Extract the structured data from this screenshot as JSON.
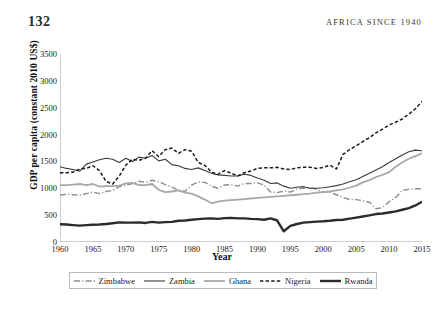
{
  "page": {
    "folio": "132",
    "running_head": "AFRICA SINCE 1940"
  },
  "chart_data": {
    "type": "line",
    "title": "",
    "xlabel": "Year",
    "ylabel": "GDP per capita (constant 2010 US$)",
    "xlim": [
      1960,
      2015
    ],
    "ylim": [
      0,
      3500
    ],
    "xticks": [
      1960,
      1965,
      1970,
      1975,
      1980,
      1985,
      1990,
      1995,
      2000,
      2005,
      2010,
      2015
    ],
    "yticks": [
      0,
      500,
      1000,
      1500,
      2000,
      2500,
      3000,
      3500
    ],
    "grid": false,
    "legend_position": "bottom",
    "x": [
      1960,
      1961,
      1962,
      1963,
      1964,
      1965,
      1966,
      1967,
      1968,
      1969,
      1970,
      1971,
      1972,
      1973,
      1974,
      1975,
      1976,
      1977,
      1978,
      1979,
      1980,
      1981,
      1982,
      1983,
      1984,
      1985,
      1986,
      1987,
      1988,
      1989,
      1990,
      1991,
      1992,
      1993,
      1994,
      1995,
      1996,
      1997,
      1998,
      1999,
      2000,
      2001,
      2002,
      2003,
      2004,
      2005,
      2006,
      2007,
      2008,
      2009,
      2010,
      2011,
      2012,
      2013,
      2014,
      2015
    ],
    "series": [
      {
        "name": "Zimbabwe",
        "color": "#8c8c8c",
        "style": "dash-dot",
        "width": 1.4,
        "values": [
          870,
          890,
          880,
          870,
          900,
          930,
          900,
          940,
          960,
          1030,
          1060,
          1090,
          1130,
          1110,
          1150,
          1120,
          1070,
          1020,
          960,
          940,
          1060,
          1120,
          1110,
          1040,
          1000,
          1060,
          1070,
          1040,
          1090,
          1090,
          1100,
          1060,
          930,
          920,
          950,
          930,
          990,
          1000,
          1010,
          980,
          930,
          930,
          880,
          830,
          790,
          790,
          770,
          740,
          620,
          640,
          750,
          830,
          960,
          980,
          990,
          990
        ]
      },
      {
        "name": "Zambia",
        "color": "#3a3a3a",
        "style": "solid",
        "width": 1.1,
        "values": [
          1400,
          1370,
          1350,
          1320,
          1450,
          1490,
          1530,
          1560,
          1540,
          1480,
          1560,
          1500,
          1580,
          1560,
          1610,
          1510,
          1540,
          1440,
          1420,
          1370,
          1350,
          1380,
          1330,
          1280,
          1250,
          1240,
          1230,
          1230,
          1260,
          1240,
          1190,
          1150,
          1090,
          1100,
          1040,
          1000,
          1020,
          1030,
          1000,
          1000,
          1010,
          1030,
          1050,
          1080,
          1120,
          1160,
          1220,
          1280,
          1340,
          1400,
          1480,
          1550,
          1620,
          1680,
          1710,
          1700
        ]
      },
      {
        "name": "Ghana",
        "color": "#a8a8a8",
        "style": "solid",
        "width": 1.8,
        "values": [
          1060,
          1060,
          1070,
          1080,
          1060,
          1080,
          1030,
          1040,
          1040,
          1050,
          1090,
          1100,
          1060,
          1060,
          1080,
          970,
          930,
          940,
          960,
          920,
          900,
          850,
          790,
          720,
          750,
          770,
          780,
          790,
          800,
          810,
          820,
          830,
          840,
          850,
          860,
          870,
          880,
          890,
          900,
          920,
          930,
          940,
          960,
          980,
          1010,
          1050,
          1110,
          1150,
          1210,
          1250,
          1300,
          1400,
          1480,
          1550,
          1600,
          1650
        ]
      },
      {
        "name": "Nigeria",
        "color": "#1a1a1a",
        "style": "dashed",
        "width": 1.5,
        "values": [
          1290,
          1290,
          1300,
          1360,
          1370,
          1420,
          1330,
          1130,
          1080,
          1230,
          1430,
          1540,
          1520,
          1560,
          1700,
          1590,
          1720,
          1750,
          1650,
          1720,
          1690,
          1480,
          1430,
          1300,
          1260,
          1330,
          1280,
          1230,
          1290,
          1320,
          1370,
          1380,
          1380,
          1390,
          1360,
          1350,
          1380,
          1390,
          1390,
          1370,
          1390,
          1430,
          1360,
          1630,
          1720,
          1790,
          1870,
          1940,
          2030,
          2100,
          2180,
          2230,
          2290,
          2380,
          2480,
          2620
        ]
      },
      {
        "name": "Rwanda",
        "color": "#2b2b2b",
        "style": "solid",
        "width": 2.4,
        "values": [
          330,
          325,
          315,
          305,
          315,
          320,
          325,
          335,
          350,
          365,
          360,
          360,
          365,
          355,
          375,
          360,
          370,
          375,
          395,
          400,
          415,
          425,
          435,
          440,
          430,
          445,
          450,
          440,
          440,
          430,
          425,
          415,
          440,
          400,
          200,
          300,
          335,
          360,
          370,
          380,
          385,
          395,
          410,
          415,
          435,
          455,
          475,
          495,
          520,
          530,
          550,
          570,
          600,
          630,
          680,
          750
        ]
      }
    ]
  },
  "legend": {
    "items": [
      {
        "label": "Zimbabwe"
      },
      {
        "label": "Zambia"
      },
      {
        "label": "Ghana"
      },
      {
        "label": "Nigeria"
      },
      {
        "label": "Rwanda"
      }
    ]
  }
}
